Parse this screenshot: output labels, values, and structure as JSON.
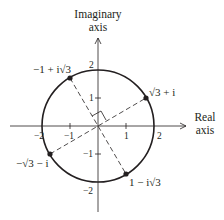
{
  "figure": {
    "colors": {
      "ink": "#231f20",
      "background": "#ffffff"
    },
    "axes": {
      "imaginary_title_line1": "Imaginary",
      "imaginary_title_line2": "axis",
      "real_title_line1": "Real",
      "real_title_line2": "axis"
    },
    "ticks": {
      "x": [
        {
          "value": -2,
          "label": "−2"
        },
        {
          "value": -1,
          "label": "−1"
        },
        {
          "value": 1,
          "label": "1"
        },
        {
          "value": 2,
          "label": "2"
        }
      ],
      "y": [
        {
          "value": 2,
          "label": "2"
        },
        {
          "value": 1,
          "label": "1"
        },
        {
          "value": -1,
          "label": "−1"
        },
        {
          "value": -2,
          "label": "−2"
        }
      ]
    },
    "circle": {
      "radius": 2
    },
    "points": [
      {
        "label": "√3 + i",
        "re": 1.732,
        "im": 1
      },
      {
        "label": "−1 + i√3",
        "re": -1,
        "im": 1.732
      },
      {
        "label": "−√3 − i",
        "re": -1.732,
        "im": -1
      },
      {
        "label": "1 − i√3",
        "re": 1,
        "im": -1.732
      }
    ]
  }
}
